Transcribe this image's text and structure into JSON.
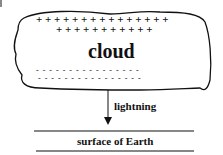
{
  "diagram": {
    "cloud_label": "cloud",
    "positive_row1": "+ + + + + + + + + + + + + + +",
    "positive_row2": "+ + + + + + + + + + +",
    "negative_row1": "- - - - - - - - - - - - - - - -",
    "negative_row2": "- - - - - - - - - - - - - - - -",
    "arrow_label": "lightning",
    "ground_label": "surface of Earth"
  }
}
